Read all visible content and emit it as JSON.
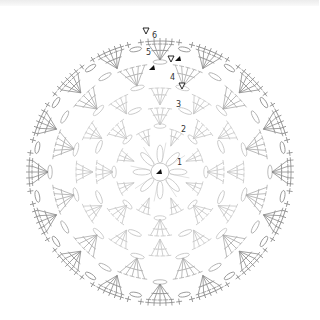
{
  "diagram": {
    "type": "crochet-round-chart",
    "center": [
      160,
      172
    ],
    "colors": {
      "inner_stitch": "#c4c4c4",
      "outer_stitch": "#8a8a8a",
      "marker": "#111111",
      "background": "#ffffff",
      "top_strip": "#eeeeee"
    },
    "round_labels": [
      {
        "text": "1",
        "x": 177,
        "y": 165
      },
      {
        "text": "2",
        "x": 181,
        "y": 132
      },
      {
        "text": "3",
        "x": 176,
        "y": 107
      },
      {
        "text": "4",
        "x": 170,
        "y": 80
      },
      {
        "text": "5",
        "x": 146,
        "y": 55
      },
      {
        "text": "6",
        "x": 152,
        "y": 38
      }
    ],
    "start_markers": [
      {
        "kind": "start-arrow",
        "x": 159,
        "y": 172
      },
      {
        "kind": "start",
        "x": 178,
        "y": 59
      },
      {
        "kind": "start",
        "x": 152,
        "y": 68
      }
    ],
    "end_markers": [
      {
        "kind": "fasten-off",
        "x": 146,
        "y": 31
      },
      {
        "kind": "fasten-off",
        "x": 171,
        "y": 59
      },
      {
        "kind": "fasten-off",
        "x": 182,
        "y": 86
      }
    ],
    "rounds": [
      {
        "round": 1,
        "radius": 26,
        "repeats": 8,
        "stitch": "petal-chain",
        "center_ring_radius": 9
      },
      {
        "round": 2,
        "radius": 45,
        "repeats": 8,
        "stitch": "dc-fan",
        "fan_size": 3
      },
      {
        "round": 3,
        "radius": 65,
        "repeats": 8,
        "stitch": "ch-space",
        "fan_size": 4
      },
      {
        "round": 4,
        "radius": 85,
        "repeats": 12,
        "stitch": "dc-fan",
        "fan_size": 4
      },
      {
        "round": 5,
        "radius": 108,
        "repeats": 12,
        "stitch": "dc-fan",
        "fan_size": 5
      },
      {
        "round": 6,
        "radius": 130,
        "repeats": 16,
        "stitch": "sc-arch",
        "fan_size": 5
      }
    ]
  }
}
